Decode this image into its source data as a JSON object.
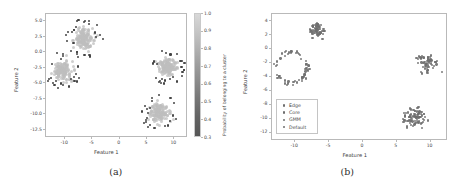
{
  "figure": {
    "panels": [
      {
        "caption": "(a)",
        "xlabel": "Feature 1",
        "ylabel": "Feature 2",
        "xticks": [
          "-10",
          "-5",
          "0",
          "5",
          "10"
        ],
        "yticks": [
          "5.0",
          "2.5",
          "0.0",
          "-2.5",
          "-5.0",
          "-7.5",
          "-10.0",
          "-12.5"
        ],
        "colorbar": {
          "title": "Probability of belonging to a cluster",
          "ticks": [
            "1.0",
            "0.9",
            "0.8",
            "0.7",
            "0.6",
            "0.5",
            "0.4",
            "0.3"
          ],
          "high_color": "#d8d8d8",
          "low_color": "#565656"
        }
      },
      {
        "caption": "(b)",
        "xlabel": "Feature 1",
        "ylabel": "Feature 2",
        "xticks": [
          "-10",
          "-5",
          "0",
          "5",
          "10"
        ],
        "yticks": [
          "4",
          "2",
          "0",
          "-2",
          "-4",
          "-6",
          "-8",
          "-10",
          "-12"
        ],
        "legend": {
          "items": [
            {
              "label": "Edge",
              "color": "#6e6e6e"
            },
            {
              "label": "Core",
              "color": "#6e6e6e"
            },
            {
              "label": "GMM",
              "color": "#6e6e6e"
            },
            {
              "label": "Default",
              "color": "#6e6e6e"
            }
          ]
        }
      }
    ]
  },
  "chart_data": [
    {
      "type": "scatter",
      "panel": "(a)",
      "title": "",
      "xlabel": "Feature 1",
      "ylabel": "Feature 2",
      "xlim": [
        -13.5,
        12.5
      ],
      "ylim": [
        -13.8,
        6.2
      ],
      "grid": false,
      "colorbar_label": "Probability of belonging to a cluster",
      "colorbar_range": [
        0.3,
        1.0
      ],
      "series": [
        {
          "name": "cluster-upper-left-core",
          "marker_color": "#bdbdbd",
          "probability": 1.0,
          "center": [
            -6.3,
            2.1
          ],
          "spread": [
            1.5,
            1.3
          ],
          "n": 150
        },
        {
          "name": "cluster-upper-left-edge",
          "marker_color": "#3a3a3a",
          "probability": 0.35,
          "center": [
            -6.3,
            2.1
          ],
          "ring_radius": 2.6,
          "n": 28
        },
        {
          "name": "cluster-left-core",
          "marker_color": "#bdbdbd",
          "probability": 1.0,
          "center": [
            -10.2,
            -3.1
          ],
          "spread": [
            1.4,
            1.2
          ],
          "n": 150
        },
        {
          "name": "cluster-left-edge",
          "marker_color": "#3a3a3a",
          "probability": 0.35,
          "center": [
            -10.2,
            -3.1
          ],
          "ring_radius": 2.5,
          "n": 22
        },
        {
          "name": "cluster-right-core",
          "marker_color": "#bdbdbd",
          "probability": 1.0,
          "center": [
            9.0,
            -2.4
          ],
          "spread": [
            1.3,
            1.2
          ],
          "n": 150
        },
        {
          "name": "cluster-right-edge",
          "marker_color": "#3a3a3a",
          "probability": 0.35,
          "center": [
            9.0,
            -2.4
          ],
          "ring_radius": 2.4,
          "n": 26
        },
        {
          "name": "cluster-bottom-core",
          "marker_color": "#bdbdbd",
          "probability": 1.0,
          "center": [
            7.6,
            -10.0
          ],
          "spread": [
            1.4,
            1.3
          ],
          "n": 150
        },
        {
          "name": "cluster-bottom-edge",
          "marker_color": "#3a3a3a",
          "probability": 0.35,
          "center": [
            7.6,
            -10.0
          ],
          "ring_radius": 2.5,
          "n": 24
        }
      ]
    },
    {
      "type": "scatter",
      "panel": "(b)",
      "title": "",
      "xlabel": "Feature 1",
      "ylabel": "Feature 2",
      "xlim": [
        -13.5,
        12.5
      ],
      "ylim": [
        -13.2,
        5.0
      ],
      "grid": false,
      "legend_position": "lower left",
      "series": [
        {
          "name": "Edge",
          "marker_color": "#6e6e6e"
        },
        {
          "name": "Core",
          "marker_color": "#6e6e6e"
        },
        {
          "name": "GMM",
          "marker_color": "#6e6e6e"
        },
        {
          "name": "Default",
          "marker_color": "#6e6e6e"
        }
      ],
      "clusters": [
        {
          "name": "cluster-top",
          "center": [
            -6.6,
            2.6
          ],
          "spread": [
            1.0,
            0.9
          ],
          "n": 60,
          "color": "#6e6e6e"
        },
        {
          "name": "cluster-left-ring",
          "center": [
            -10.4,
            -2.9
          ],
          "ring_radius": 2.3,
          "n": 58,
          "color": "#6e6e6e"
        },
        {
          "name": "cluster-right",
          "center": [
            9.6,
            -2.2
          ],
          "spread": [
            1.3,
            1.1
          ],
          "n": 55,
          "color": "#6e6e6e"
        },
        {
          "name": "cluster-bottom",
          "center": [
            7.8,
            -9.9
          ],
          "spread": [
            1.6,
            1.3
          ],
          "n": 80,
          "color": "#6e6e6e"
        }
      ]
    }
  ]
}
